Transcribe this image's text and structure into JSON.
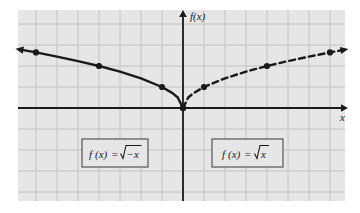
{
  "figure": {
    "kind": "cartesian-graph",
    "background_color": "#ffffff",
    "plot": {
      "fill_color": "#e6e6e6",
      "left": 18,
      "top": 10,
      "width": 327,
      "height": 191
    },
    "grid": {
      "visible": true,
      "line_color": "#bfbfbf",
      "spacing_px": 21
    },
    "axes": {
      "color": "#1a1a1a",
      "x_axis": {
        "label": "x",
        "y_px": 108,
        "arrow_right": true,
        "arrow_left": false
      },
      "y_axis": {
        "label": "f(x)",
        "x_px": 183,
        "arrow_up": true,
        "arrow_down": false
      }
    }
  },
  "chart_data": {
    "type": "line",
    "title": "",
    "xlabel": "x",
    "ylabel": "f(x)",
    "grid": true,
    "legend_position": "inside-boxes",
    "xlim": [
      -7.857,
      7.714
    ],
    "ylim": [
      -4.429,
      4.667
    ],
    "series": [
      {
        "name": "f(x) = √−x",
        "style": "solid",
        "color": "#1a1a1a",
        "arrow_at_left_end": true,
        "domain": "x ≤ 0",
        "points": [
          {
            "x": -7.6,
            "y": 2.757
          },
          {
            "x": -7.0,
            "y": 2.646
          },
          {
            "x": -6.0,
            "y": 2.449
          },
          {
            "x": -5.0,
            "y": 2.236
          },
          {
            "x": -4.0,
            "y": 2.0
          },
          {
            "x": -3.0,
            "y": 1.732
          },
          {
            "x": -2.0,
            "y": 1.414
          },
          {
            "x": -1.0,
            "y": 1.0
          },
          {
            "x": -0.5,
            "y": 0.707
          },
          {
            "x": -0.25,
            "y": 0.5
          },
          {
            "x": 0.0,
            "y": 0.0
          }
        ],
        "marked_points": [
          {
            "x": -7.0,
            "y": 2.646
          },
          {
            "x": -4.0,
            "y": 2.0
          },
          {
            "x": -1.0,
            "y": 1.0
          },
          {
            "x": 0.0,
            "y": 0.0
          }
        ]
      },
      {
        "name": "f(x) = √x",
        "style": "dashed",
        "color": "#1a1a1a",
        "arrow_at_right_end": true,
        "domain": "x ≥ 0",
        "points": [
          {
            "x": 0.0,
            "y": 0.0
          },
          {
            "x": 0.25,
            "y": 0.5
          },
          {
            "x": 0.5,
            "y": 0.707
          },
          {
            "x": 1.0,
            "y": 1.0
          },
          {
            "x": 2.0,
            "y": 1.414
          },
          {
            "x": 3.0,
            "y": 1.732
          },
          {
            "x": 4.0,
            "y": 2.0
          },
          {
            "x": 5.0,
            "y": 2.236
          },
          {
            "x": 6.0,
            "y": 2.449
          },
          {
            "x": 7.0,
            "y": 2.646
          },
          {
            "x": 7.5,
            "y": 2.739
          }
        ],
        "marked_points": [
          {
            "x": 0.0,
            "y": 0.0
          },
          {
            "x": 1.0,
            "y": 1.0
          },
          {
            "x": 4.0,
            "y": 2.0
          },
          {
            "x": 7.0,
            "y": 2.646
          }
        ]
      }
    ]
  },
  "labels": {
    "left_box": {
      "fn": "f",
      "arg": "(x)",
      "equals": "=",
      "radicand": "−x",
      "full_text": "f(x) = √−x",
      "box": {
        "x": 82,
        "y": 139,
        "width": 66,
        "height": 28
      },
      "border_color": "#555555",
      "fill_color": "#e6e6e6"
    },
    "right_box": {
      "fn": "f",
      "arg": "(x)",
      "equals": "=",
      "radicand": "x",
      "full_text": "f(x) = √x",
      "box": {
        "x": 212,
        "y": 139,
        "width": 71,
        "height": 28
      },
      "border_color": "#555555",
      "fill_color": "#e6e6e6"
    }
  }
}
